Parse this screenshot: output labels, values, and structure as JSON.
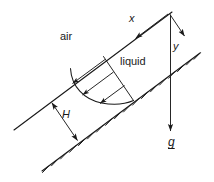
{
  "figure": {
    "type": "physics-schematic",
    "background_color": "#ffffff",
    "stroke_color": "#1a1a1a",
    "text_color": "#1a1a1a",
    "labels": {
      "air": "air",
      "liquid": "liquid",
      "x_axis": "x",
      "y_axis": "y",
      "thickness": "H",
      "gravity": "g"
    },
    "elements": {
      "free_surface": "free-surface-line",
      "wall": "inclined-wall-line",
      "wall_hatching": "wall-hatch-marks",
      "velocity_profile": "parabolic-velocity-profile",
      "velocity_arrows": "velocity-vector-arrows",
      "thickness_dimension": "film-thickness-double-arrow",
      "gravity_vector": "gravity-arrow",
      "x_arrow": "x-axis-arrow",
      "y_arrow": "y-axis-arrow"
    },
    "geometry": {
      "incline_angle_deg": 33,
      "velocity_arrow_count": 3
    }
  }
}
